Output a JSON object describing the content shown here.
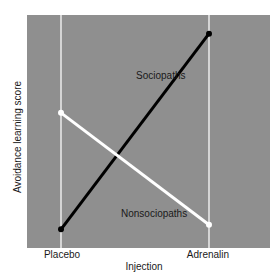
{
  "chart_data": {
    "type": "line",
    "title": "",
    "xlabel": "Injection",
    "ylabel": "Avoidance learning score",
    "categories": [
      "Placebo",
      "Adrenalin"
    ],
    "series": [
      {
        "name": "Sociopaths",
        "color": "#000000",
        "values": [
          0.08,
          0.92
        ]
      },
      {
        "name": "Nonsociopaths",
        "color": "#ffffff",
        "values": [
          0.58,
          0.1
        ]
      }
    ],
    "ylim": [
      0,
      1
    ],
    "y_ticks": [],
    "grid": false,
    "legend": "inline labels",
    "annotations": [
      {
        "text": "Sociopaths",
        "near": "Sociopaths line, upper right"
      },
      {
        "text": "Nonsociopaths",
        "near": "Nonsociopaths line, lower right"
      }
    ],
    "background_color": "#8f8f8f"
  },
  "labels": {
    "x_axis": "Injection",
    "y_axis": "Avoidance learning score",
    "x_tick_placebo": "Placebo",
    "x_tick_adrenalin": "Adrenalin",
    "series_sociopaths": "Sociopaths",
    "series_nonsociopaths": "Nonsociopaths"
  }
}
